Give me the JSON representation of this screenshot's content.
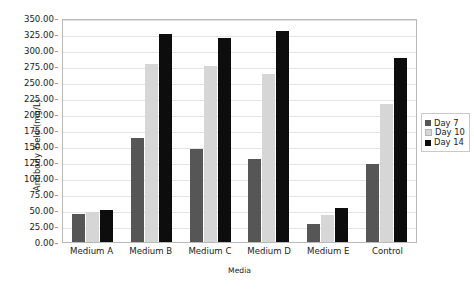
{
  "chart_data": {
    "type": "bar",
    "title": "",
    "xlabel": "Media",
    "ylabel": "Antibody Yield (mg/L)",
    "categories": [
      "Medium A",
      "Medium B",
      "Medium C",
      "Medium D",
      "Medium E",
      "Control"
    ],
    "series": [
      {
        "name": "Day 7",
        "color": "#565656",
        "values": [
          43,
          163,
          145,
          130,
          28,
          122
        ]
      },
      {
        "name": "Day 10",
        "color": "#d6d6d6",
        "values": [
          47,
          278,
          275,
          262,
          42,
          216
        ]
      },
      {
        "name": "Day 14",
        "color": "#0d0d0d",
        "values": [
          50,
          325,
          318,
          330,
          53,
          288
        ]
      }
    ],
    "ylim": [
      0,
      350
    ],
    "ytick_step": 25,
    "ytick_labels": [
      "0.00",
      "25.00",
      "50.00",
      "75.00",
      "100.00",
      "125.00",
      "150.00",
      "175.00",
      "200.00",
      "225.00",
      "250.00",
      "275.00",
      "300.00",
      "325.00",
      "350.00"
    ],
    "grid": true,
    "legend_position": "right",
    "legend_entries": [
      "Day 7",
      "Day 10",
      "Day 14"
    ]
  }
}
